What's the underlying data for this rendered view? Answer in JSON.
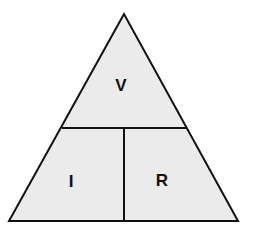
{
  "diagram": {
    "top_label": "V",
    "bottom_left_label": "I",
    "bottom_right_label": "R",
    "colors": {
      "fill": "#ebebeb",
      "stroke": "#111111",
      "text": "#111111",
      "background": "#ffffff"
    }
  }
}
